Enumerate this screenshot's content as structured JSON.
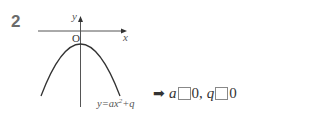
{
  "problem": {
    "number": "2"
  },
  "graph": {
    "x_axis_label": "x",
    "y_axis_label": "y",
    "origin_label": "O",
    "curve_label": "y=ax",
    "curve_label_exp": "2",
    "curve_label_tail": "+q",
    "curve": "downward parabola, vertex below origin on y-axis"
  },
  "answer": {
    "arrow_icon": "➡",
    "var_a": "a",
    "value_a": "0",
    "separator": ",",
    "var_q": "q",
    "value_q": "0"
  }
}
